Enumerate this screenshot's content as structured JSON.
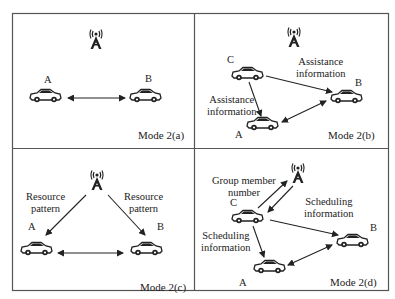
{
  "figure": {
    "panels": [
      {
        "id": "a",
        "mode_label": "Mode 2(a)",
        "nodes": {
          "A": "A",
          "B": "B"
        }
      },
      {
        "id": "b",
        "mode_label": "Mode 2(b)",
        "nodes": {
          "A": "A",
          "B": "B",
          "C": "C"
        },
        "labels": {
          "top": "Assistance\ninformation",
          "left": "Assistance\ninformation"
        },
        "label_lines": {
          "top": [
            "Assistance",
            "information"
          ],
          "left": [
            "Assistance",
            "information"
          ]
        }
      },
      {
        "id": "c",
        "mode_label": "Mode 2(c)",
        "nodes": {
          "A": "A",
          "B": "B"
        },
        "label_lines": {
          "left": [
            "Resource",
            "pattern"
          ],
          "right": [
            "Resource",
            "pattern"
          ]
        }
      },
      {
        "id": "d",
        "mode_label": "Mode 2(d)",
        "nodes": {
          "A": "A",
          "B": "B",
          "C": "C"
        },
        "label_lines": {
          "group": [
            "Group member",
            "number"
          ],
          "right": [
            "Scheduling",
            "information"
          ],
          "left": [
            "Scheduling",
            "information"
          ]
        }
      }
    ],
    "icons": {
      "tower": "cell-tower-icon",
      "vehicle": "car-icon"
    },
    "colors": {
      "line": "#222222",
      "frame": "#555555",
      "background": "#ffffff"
    }
  }
}
